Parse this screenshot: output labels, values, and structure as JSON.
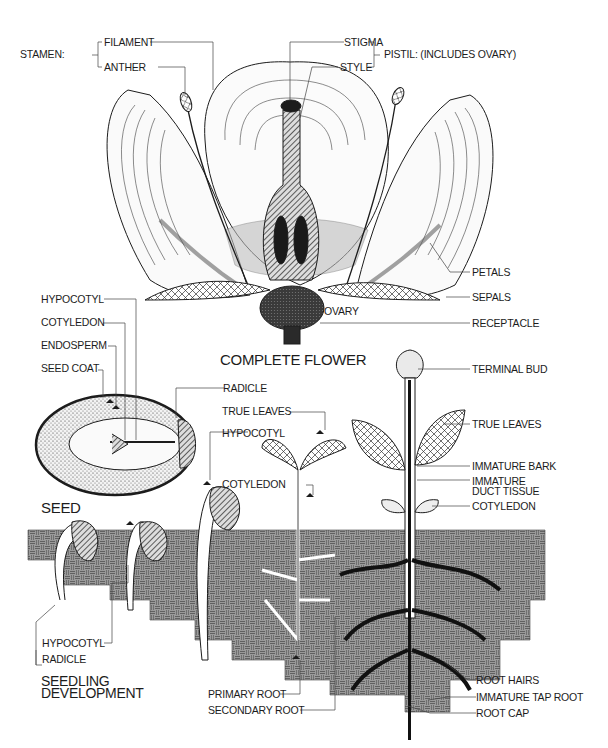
{
  "flower": {
    "title": "COMPLETE FLOWER",
    "stamen_group": "STAMEN:",
    "filament": "FILAMENT",
    "anther": "ANTHER",
    "stigma": "STIGMA",
    "style": "STYLE",
    "pistil_group": "PISTIL: (INCLUDES OVARY)",
    "petals": "PETALS",
    "sepals": "SEPALS",
    "ovary": "OVARY",
    "receptacle": "RECEPTACLE"
  },
  "seed": {
    "title": "SEED",
    "hypocotyl": "HYPOCOTYL",
    "cotyledon": "COTYLEDON",
    "endosperm": "ENDOSPERM",
    "seed_coat": "SEED COAT",
    "radicle": "RADICLE"
  },
  "seedling": {
    "title_line1": "SEEDLING",
    "title_line2": "DEVELOPMENT",
    "true_leaves": "TRUE LEAVES",
    "hypocotyl_upper": "HYPOCOTYL",
    "cotyledon": "COTYLEDON",
    "hypocotyl_lower": "HYPOCOTYL",
    "radicle": "RADICLE",
    "primary_root": "PRIMARY ROOT",
    "secondary_root": "SECONDARY ROOT"
  },
  "plant": {
    "terminal_bud": "TERMINAL BUD",
    "true_leaves": "TRUE LEAVES",
    "immature_bark": "IMMATURE  BARK",
    "immature_duct_line1": "IMMATURE",
    "immature_duct_line2": "DUCT TISSUE",
    "cotyledon": "COTYLEDON",
    "root_hairs": "ROOT HAIRS",
    "immature_tap_root": "IMMATURE  TAP ROOT",
    "root_cap": "ROOT CAP"
  },
  "colors": {
    "ink": "#1c1c1c",
    "soil": "#8a8a8a",
    "paper": "#ffffff"
  }
}
